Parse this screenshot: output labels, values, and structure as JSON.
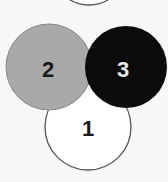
{
  "diagram": {
    "background": "#f7f7f7",
    "circles": [
      {
        "label": "1",
        "fill": "#ffffff",
        "stroke": "#555555",
        "text_color": "#1a1a1a"
      },
      {
        "label": "2",
        "fill": "#a9a9a9",
        "stroke": "#888888",
        "text_color": "#1a1a1a"
      },
      {
        "label": "3",
        "fill": "#0b0b0b",
        "stroke": "#0b0b0b",
        "text_color": "#e8e8e8"
      }
    ],
    "partial_top_circle": {
      "fill": "#ffffff",
      "stroke": "#555555"
    }
  }
}
